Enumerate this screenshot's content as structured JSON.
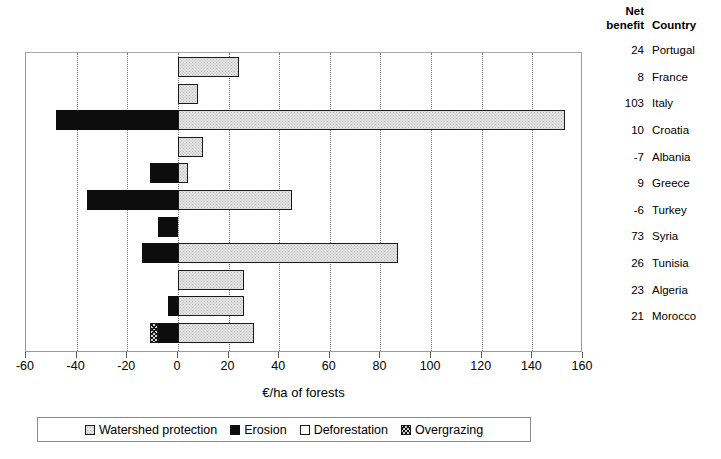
{
  "chart_data": {
    "type": "bar",
    "orientation": "horizontal",
    "stacked": true,
    "title": "",
    "xlabel": "€/ha of forests",
    "ylabel": "",
    "xlim": [
      -60,
      160
    ],
    "xticks": [
      -60,
      -40,
      -20,
      0,
      20,
      40,
      60,
      80,
      100,
      120,
      140,
      160
    ],
    "xtick_labels": [
      "-60",
      "-40",
      "-20",
      "0",
      "20",
      "40",
      "60",
      "80",
      "100",
      "120",
      "140",
      "160"
    ],
    "grid": true,
    "grid_style": "dotted-vertical",
    "legend_position": "bottom",
    "legend": [
      "Watershed protection",
      "Erosion",
      "Deforestation",
      "Overgrazing"
    ],
    "categories": [
      "Portugal",
      "France",
      "Italy",
      "Croatia",
      "Albania",
      "Greece",
      "Turkey",
      "Syria",
      "Tunisia",
      "Algeria",
      "Morocco"
    ],
    "series": [
      {
        "name": "Watershed protection",
        "color": "#e3e3e3",
        "values": [
          24,
          8,
          153,
          10,
          4,
          45,
          0,
          87,
          26,
          26,
          30
        ]
      },
      {
        "name": "Erosion",
        "color": "#0d0d0d",
        "values": [
          0,
          0,
          -48,
          0,
          -11,
          -36,
          -8,
          -14,
          0,
          -4,
          -8
        ]
      },
      {
        "name": "Deforestation",
        "color": "#ffffff",
        "values": [
          0,
          0,
          0,
          0,
          0,
          0,
          0,
          0,
          0,
          0,
          0
        ]
      },
      {
        "name": "Overgrazing",
        "color": "#d2d2d2",
        "values": [
          0,
          0,
          0,
          0,
          0,
          0,
          0,
          0,
          0,
          0,
          -3
        ]
      }
    ],
    "net_benefit": [
      24,
      8,
      103,
      10,
      -7,
      9,
      -6,
      73,
      26,
      23,
      21
    ]
  },
  "table": {
    "header_line1": "Net",
    "header_line2": "benefit",
    "header_country": "Country",
    "rows": [
      {
        "net": "24",
        "country": "Portugal"
      },
      {
        "net": "8",
        "country": "France"
      },
      {
        "net": "103",
        "country": "Italy"
      },
      {
        "net": "10",
        "country": "Croatia"
      },
      {
        "net": "-7",
        "country": "Albania"
      },
      {
        "net": "9",
        "country": "Greece"
      },
      {
        "net": "-6",
        "country": "Turkey"
      },
      {
        "net": "73",
        "country": "Syria"
      },
      {
        "net": "26",
        "country": "Tunisia"
      },
      {
        "net": "23",
        "country": "Algeria"
      },
      {
        "net": "21",
        "country": "Morocco"
      }
    ]
  },
  "axis": {
    "title": "€/ha of forests"
  },
  "legend": {
    "items": [
      {
        "label": "Watershed protection",
        "key": "watershed"
      },
      {
        "label": "Erosion",
        "key": "erosion"
      },
      {
        "label": "Deforestation",
        "key": "deforestation"
      },
      {
        "label": "Overgrazing",
        "key": "overgrazing"
      }
    ]
  }
}
